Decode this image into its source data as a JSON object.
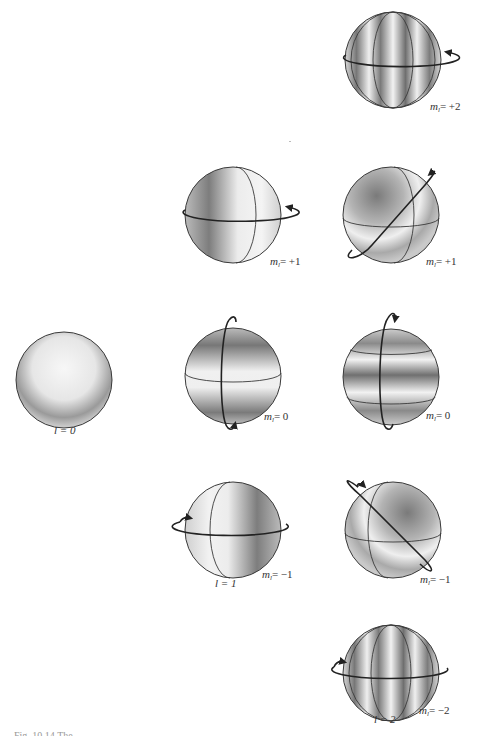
{
  "figure": {
    "caption_partial": "Fig. 10.14 The ..."
  },
  "spheres": [
    {
      "id": "l2-m+2",
      "l": 2,
      "ml": "+2",
      "label": "= +2",
      "cx": 393,
      "cy": 60,
      "ring": "horizontal",
      "bands": "vertical-4"
    },
    {
      "id": "l1-m+1",
      "l": 1,
      "ml": "+1",
      "label": "= +1",
      "cx": 233,
      "cy": 215,
      "ring": "horizontal",
      "bands": "vertical-2"
    },
    {
      "id": "l2-m+1",
      "l": 2,
      "ml": "+1",
      "label": "= +1",
      "cx": 391,
      "cy": 215,
      "ring": "diagonal-up",
      "bands": "quadrant"
    },
    {
      "id": "l0-m0",
      "l": 0,
      "ml": "0",
      "label": "l = 0",
      "cx": 64,
      "cy": 380,
      "ring": "none",
      "bands": "uniform"
    },
    {
      "id": "l1-m0",
      "l": 1,
      "ml": "0",
      "label": "= 0",
      "cx": 233,
      "cy": 376,
      "ring": "vertical",
      "bands": "horizontal-2"
    },
    {
      "id": "l2-m0",
      "l": 2,
      "ml": "0",
      "label": "= 0",
      "cx": 391,
      "cy": 377,
      "ring": "vertical",
      "bands": "horizontal-3"
    },
    {
      "id": "l1-m-1",
      "l": 1,
      "ml": "−1",
      "label": "= −1",
      "cx": 233,
      "cy": 530,
      "ring": "horizontal",
      "bands": "vertical-2"
    },
    {
      "id": "l2-m-1",
      "l": 2,
      "ml": "−1",
      "label": "= −1",
      "cx": 393,
      "cy": 530,
      "ring": "diagonal-down",
      "bands": "quadrant"
    },
    {
      "id": "l2-m-2",
      "l": 2,
      "ml": "−2",
      "label": "= −2",
      "cx": 391,
      "cy": 673,
      "ring": "horizontal",
      "bands": "vertical-4"
    }
  ],
  "labels": {
    "ml_prefix": "m",
    "ml_sub": "l",
    "m2p": "= +2",
    "m1p_a": "= +1",
    "m1p_b": "= +1",
    "m0_a": "= 0",
    "m0_b": "= 0",
    "m1n_a": "= −1",
    "m1n_b": "= −1",
    "m2n": "= −2",
    "l0": "l = 0",
    "l1": "l = 1",
    "l2": "l = 2"
  },
  "colors": {
    "outline": "#3a3a3a",
    "shade_dark": "#6e6e6e",
    "shade_light": "#f4f4f4",
    "background": "#ffffff"
  }
}
